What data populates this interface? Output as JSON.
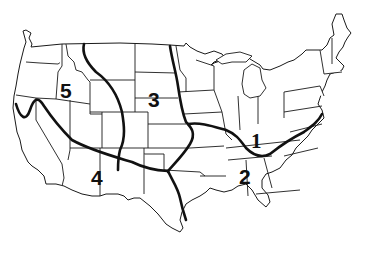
{
  "map": {
    "subject": "Contiguous United States divided into five numbered regions",
    "background_color": "#ffffff",
    "line_color": "#111111",
    "regions": [
      {
        "id": "1",
        "label": "1",
        "area": "Great Lakes / Northeast",
        "label_x": 251,
        "label_y": 152
      },
      {
        "id": "2",
        "label": "2",
        "area": "Southeast",
        "label_x": 244,
        "label_y": 185
      },
      {
        "id": "3",
        "label": "3",
        "area": "Great Plains",
        "label_x": 155,
        "label_y": 97
      },
      {
        "id": "4",
        "label": "4",
        "area": "Southwest",
        "label_x": 97,
        "label_y": 178
      },
      {
        "id": "5",
        "label": "5",
        "area": "Northwest / Intermountain",
        "label_x": 68,
        "label_y": 92
      }
    ],
    "region_boundaries": [
      "California Sierra curve through Nevada/Utah to Oklahoma panhandle",
      "Montana/Wyoming-Colorado divide south to New Mexico",
      "Red River / Mississippi north from Oklahoma to Minnesota",
      "Oklahoma-Texas line south to Gulf coast",
      "Ohio River / Appalachian line from Missouri east to Chesapeake Bay"
    ]
  }
}
